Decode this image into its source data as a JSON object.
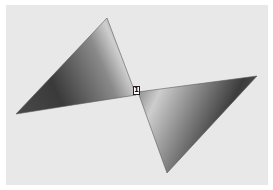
{
  "scene": {
    "description": "Grayscale 3D-shaded render of two triangular facets joined at a single shared vertex",
    "vertex_label": "1",
    "colors": {
      "background": "#e8e8e8",
      "border": "#ffffff",
      "shade_dark": "#3a3a3a",
      "shade_mid": "#7a7a7a",
      "shade_light": "#c8c8c8"
    }
  }
}
